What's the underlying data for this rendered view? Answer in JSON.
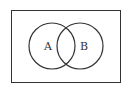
{
  "diagram": {
    "type": "venn",
    "universe": {
      "x": 11,
      "y": 10,
      "width": 109,
      "height": 73
    },
    "sets": [
      {
        "label": "A",
        "cx": 52,
        "cy": 46,
        "r": 23,
        "label_x": 44,
        "label_y": 50
      },
      {
        "label": "B",
        "cx": 80,
        "cy": 46,
        "r": 23,
        "label_x": 83,
        "label_y": 50
      }
    ],
    "stroke_color": "#333333",
    "background": "#ffffff"
  }
}
